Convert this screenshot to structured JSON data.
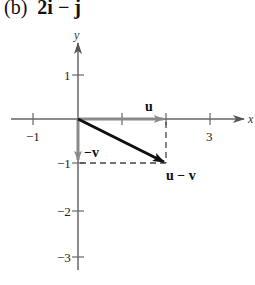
{
  "title": {
    "part": "(b)",
    "expression": "2i − j"
  },
  "axes": {
    "x_label": "x",
    "y_label": "y",
    "x_ticks": [
      "−1",
      "1",
      "2",
      "3"
    ],
    "x_tick_labels_shown": [
      "−1",
      "3"
    ],
    "y_ticks": [
      "1",
      "−1",
      "−2",
      "−3"
    ],
    "y_tick_labels_shown": [
      "1",
      "−1",
      "−2",
      "−3"
    ]
  },
  "vectors": {
    "u": {
      "label": "u",
      "from": [
        0,
        0
      ],
      "to": [
        2,
        0
      ],
      "color": "#8a8a8a"
    },
    "neg_v": {
      "label": "−v",
      "from": [
        0,
        0
      ],
      "to": [
        0,
        -1
      ],
      "color": "#8a8a8a"
    },
    "u_minus_v": {
      "label": "u − v",
      "from": [
        0,
        0
      ],
      "to": [
        2,
        -1
      ],
      "color": "#111111"
    }
  },
  "guides": {
    "dashed": [
      [
        [
          0,
          -1
        ],
        [
          2,
          -1
        ]
      ],
      [
        [
          2,
          0
        ],
        [
          2,
          -1
        ]
      ]
    ]
  }
}
